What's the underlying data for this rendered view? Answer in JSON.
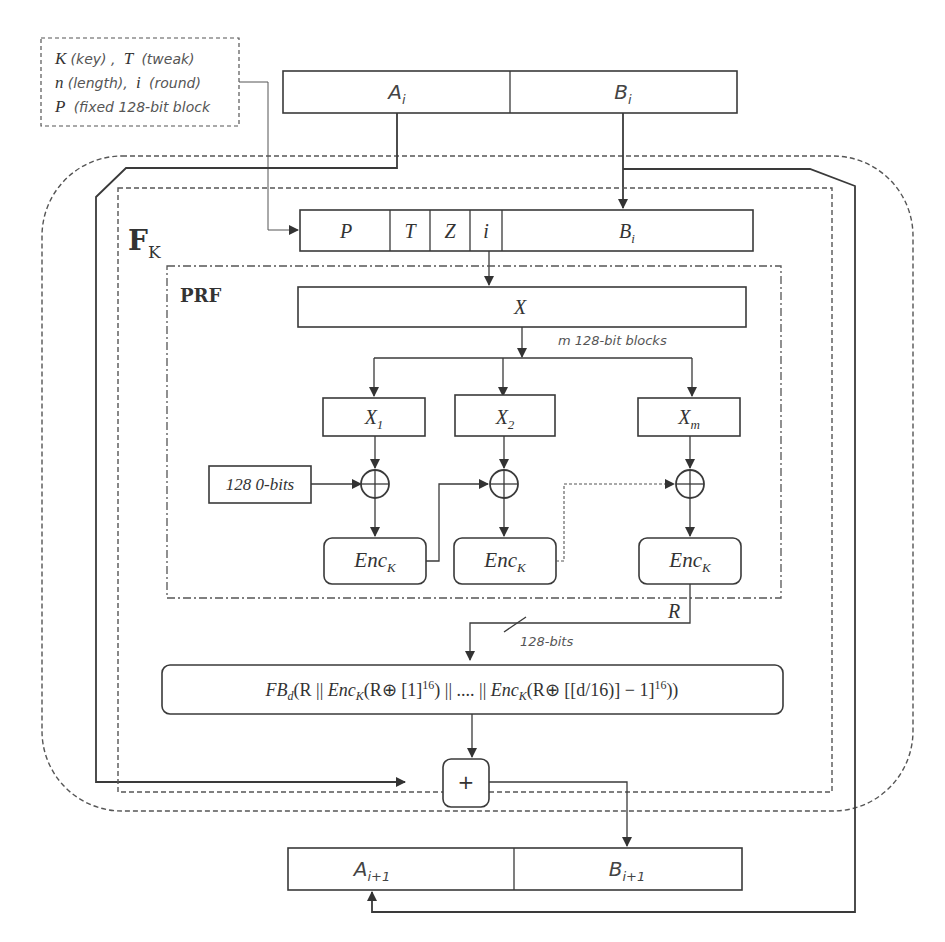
{
  "legend": {
    "line1": {
      "k": "K",
      "k_desc": "(key) ,",
      "t": "T",
      "t_desc": "(tweak)"
    },
    "line2": {
      "n": "n",
      "n_desc": "(length),",
      "i": "i",
      "i_desc": "(round)"
    },
    "line3": {
      "p": "P",
      "p_desc": "(fixed 128-bit block"
    }
  },
  "input_bar": {
    "a": "A",
    "a_sub": "i",
    "b": "B",
    "b_sub": "i"
  },
  "fk_label": {
    "main": "F",
    "sub": "K"
  },
  "tweak_bar": {
    "p": "P",
    "t": "T",
    "z": "Z",
    "i": "i",
    "b": "B",
    "b_sub": "i"
  },
  "prf": {
    "label": "PRF",
    "x_box": "X",
    "split_label": "m  128-bit blocks",
    "blocks": [
      {
        "name": "X",
        "sub": "1"
      },
      {
        "name": "X",
        "sub": "2"
      },
      {
        "name": "X",
        "sub": "m"
      }
    ],
    "zero_input": "128 0-bits",
    "enc": [
      {
        "name": "Enc",
        "sub": "K"
      },
      {
        "name": "Enc",
        "sub": "K"
      },
      {
        "name": "Enc",
        "sub": "K"
      }
    ]
  },
  "r_label": "R",
  "bits_label": "128-bits",
  "fb_formula": {
    "fb": "FB",
    "d": "d",
    "p1": "(R || ",
    "enc1": "Enc",
    "k1": "K",
    "p2": "(R⊕ [1]",
    "sup1": "16",
    "p3": ") || .... || ",
    "enc2": "Enc",
    "k2": "K",
    "p4": "(R⊕ [[d/16)] − 1]",
    "sup2": "16",
    "p5": "))"
  },
  "plus_symbol": "+",
  "output_bar": {
    "a": "A",
    "a_sub": "i+1",
    "b": "B",
    "b_sub": "i+1"
  },
  "colors": {
    "stroke": "#3a3a3a",
    "text": "#333333",
    "label": "#555555"
  }
}
